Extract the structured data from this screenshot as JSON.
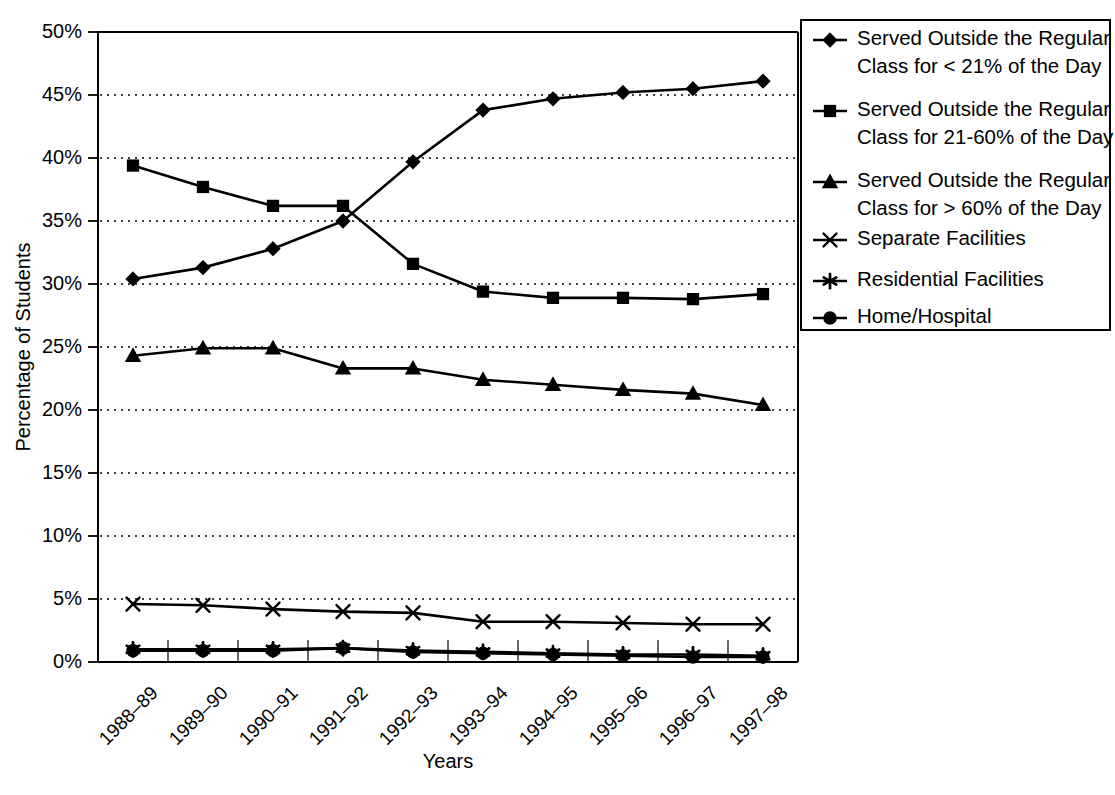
{
  "chart_data": {
    "type": "line",
    "title": "",
    "xlabel": "Years",
    "ylabel": "Percentage of Students",
    "ylim": [
      0,
      50
    ],
    "ytick_labels": [
      "0%",
      "5%",
      "10%",
      "15%",
      "20%",
      "25%",
      "30%",
      "35%",
      "40%",
      "45%",
      "50%"
    ],
    "ytick_values": [
      0,
      5,
      10,
      15,
      20,
      25,
      30,
      35,
      40,
      45,
      50
    ],
    "grid": "horizontal-dotted",
    "legend_position": "right",
    "categories": [
      "1988–89",
      "1989–90",
      "1990–91",
      "1991–92",
      "1992–93",
      "1993–94",
      "1994–95",
      "1995–96",
      "1996–97",
      "1997–98"
    ],
    "series": [
      {
        "name": "Served Outside the Regular Class for < 21% of the Day",
        "marker": "diamond",
        "values": [
          30.4,
          31.3,
          32.8,
          35.0,
          39.7,
          43.8,
          44.7,
          45.2,
          45.5,
          46.1
        ]
      },
      {
        "name": "Served Outside the Regular Class for 21-60% of the Day",
        "marker": "square",
        "values": [
          39.4,
          37.7,
          36.2,
          36.2,
          31.6,
          29.4,
          28.9,
          28.9,
          28.8,
          29.2
        ]
      },
      {
        "name": "Served Outside the Regular Class for > 60% of the Day",
        "marker": "triangle",
        "values": [
          24.3,
          24.9,
          24.9,
          23.3,
          23.3,
          22.4,
          22.0,
          21.6,
          21.3,
          20.4
        ]
      },
      {
        "name": "Separate Facilities",
        "marker": "x",
        "values": [
          4.6,
          4.5,
          4.2,
          4.0,
          3.9,
          3.2,
          3.2,
          3.1,
          3.0,
          3.0
        ]
      },
      {
        "name": "Residential Facilities",
        "marker": "asterisk",
        "values": [
          1.0,
          1.0,
          1.0,
          1.1,
          0.9,
          0.8,
          0.7,
          0.6,
          0.6,
          0.5
        ]
      },
      {
        "name": "Home/Hospital",
        "marker": "circle",
        "values": [
          0.9,
          0.9,
          0.9,
          1.1,
          0.8,
          0.7,
          0.6,
          0.5,
          0.4,
          0.4
        ]
      }
    ]
  },
  "legend": {
    "entries": [
      {
        "label_line1": "Served Outside the Regular",
        "label_line2": "Class for < 21% of the Day",
        "marker": "diamond"
      },
      {
        "label_line1": "Served Outside the Regular",
        "label_line2": "Class for 21-60% of the Day",
        "marker": "square"
      },
      {
        "label_line1": "Served Outside the Regular",
        "label_line2": "Class for > 60% of the Day",
        "marker": "triangle"
      },
      {
        "label_line1": "Separate Facilities",
        "label_line2": "",
        "marker": "x"
      },
      {
        "label_line1": "Residential Facilities",
        "label_line2": "",
        "marker": "asterisk"
      },
      {
        "label_line1": "Home/Hospital",
        "label_line2": "",
        "marker": "circle"
      }
    ]
  },
  "colors": {
    "ink": "#000000",
    "background": "#ffffff"
  }
}
